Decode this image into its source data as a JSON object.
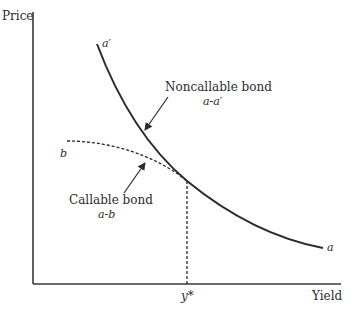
{
  "figure": {
    "axes": {
      "y_label": "Price",
      "x_label": "Yield",
      "x_marker": "y*"
    },
    "curves": {
      "noncallable": {
        "label": "Noncallable bond",
        "sublabel": "a-a′",
        "start_label": "a′",
        "end_label": "a",
        "style": "solid"
      },
      "callable": {
        "label": "Callable bond",
        "sublabel": "a-b",
        "start_label": "b",
        "style": "dashed"
      }
    },
    "colors": {
      "line": "#2b2b2b",
      "background": "#ffffff"
    }
  }
}
